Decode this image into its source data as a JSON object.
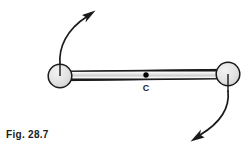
{
  "figure": {
    "caption": "Fig. 28.7",
    "center_label": "C",
    "colors": {
      "stroke": "#1a1a1a",
      "sphere_fill": "#e3e3e3",
      "rod_fill": "#d9d9d9",
      "background": "#ffffff"
    }
  },
  "diagram_data": {
    "type": "physics-free-body-diagram",
    "description": "Rigid rod (dumbbell) with two spherical masses at its ends, center of mass marked C, with curved arrows showing rotational motion of each end",
    "elements": [
      {
        "name": "left-sphere",
        "kind": "circle",
        "cx": 60,
        "cy": 76,
        "r": 12,
        "fill": "#e3e3e3",
        "stroke": "#1a1a1a"
      },
      {
        "name": "right-sphere",
        "kind": "circle",
        "cx": 228,
        "cy": 74,
        "r": 12,
        "fill": "#e3e3e3",
        "stroke": "#1a1a1a"
      },
      {
        "name": "connecting-rod",
        "kind": "rod",
        "x1": 60,
        "y1": 76,
        "x2": 228,
        "y2": 74,
        "thickness": 4
      },
      {
        "name": "center-of-mass-dot",
        "kind": "point",
        "cx": 146,
        "cy": 75,
        "r": 2.6,
        "label": "C",
        "label_x": 146,
        "label_y": 90
      },
      {
        "name": "left-radius-line",
        "kind": "line",
        "x1": 60,
        "y1": 76,
        "x2": 60,
        "y2": 63
      },
      {
        "name": "right-radius-line",
        "kind": "line",
        "x1": 228,
        "y1": 74,
        "x2": 228,
        "y2": 92
      },
      {
        "name": "upper-left-motion-arrow",
        "kind": "curved-arrow",
        "direction": "up-right",
        "path": "M 60,63 C 59,48 66,30 88,16",
        "tip": [
          93,
          12
        ]
      },
      {
        "name": "lower-right-motion-arrow",
        "kind": "curved-arrow",
        "direction": "down-left",
        "path": "M 228,92 C 229,108 221,122 198,136",
        "tip": [
          192,
          140
        ]
      }
    ]
  }
}
